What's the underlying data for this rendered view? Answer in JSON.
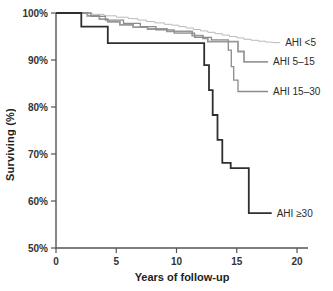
{
  "figure": {
    "background": "#ffffff",
    "axis_color": "#555555",
    "tick_label_color": "#333333"
  },
  "chart_data": {
    "type": "line",
    "subtype": "kaplan-meier-step-survival",
    "title": "",
    "xlabel": "Years of follow-up",
    "ylabel": "Surviving (%)",
    "xlim": [
      0,
      20
    ],
    "ylim": [
      50,
      100
    ],
    "grid": false,
    "legend_position": "right-of-curve-ends",
    "xticks": {
      "values": [
        0,
        5,
        10,
        15,
        20
      ],
      "labels": [
        "0",
        "5",
        "10",
        "15",
        "20"
      ]
    },
    "yticks": {
      "values": [
        100,
        90,
        80,
        70,
        60,
        50
      ],
      "labels": [
        "100%",
        "90%",
        "80%",
        "70%",
        "60%",
        "50%"
      ]
    },
    "series": [
      {
        "name": "AHI <5",
        "color": "#b3b3b3",
        "width": 0.9,
        "end_x": 18.6,
        "steps": [
          [
            0,
            100
          ],
          [
            3.0,
            99.7
          ],
          [
            4.0,
            99.4
          ],
          [
            5.0,
            99.1
          ],
          [
            6.0,
            98.8
          ],
          [
            6.8,
            98.5
          ],
          [
            7.5,
            98.2
          ],
          [
            8.2,
            97.9
          ],
          [
            9.0,
            97.6
          ],
          [
            9.6,
            97.4
          ],
          [
            10.2,
            97.1
          ],
          [
            10.8,
            96.8
          ],
          [
            11.4,
            96.5
          ],
          [
            12.0,
            96.2
          ],
          [
            12.6,
            95.9
          ],
          [
            13.2,
            95.6
          ],
          [
            13.8,
            95.3
          ],
          [
            14.4,
            95.0
          ],
          [
            15.0,
            94.7
          ],
          [
            15.6,
            94.4
          ],
          [
            16.2,
            94.2
          ],
          [
            16.8,
            94.0
          ],
          [
            17.4,
            93.8
          ],
          [
            18.0,
            93.7
          ]
        ]
      },
      {
        "name": "AHI 5–15",
        "color": "#999999",
        "width": 1.8,
        "end_x": 17.6,
        "steps": [
          [
            0,
            100
          ],
          [
            2.6,
            99.4
          ],
          [
            3.6,
            98.7
          ],
          [
            4.3,
            98.1
          ],
          [
            5.3,
            97.5
          ],
          [
            6.4,
            97.0
          ],
          [
            7.6,
            96.6
          ],
          [
            9.2,
            96.1
          ],
          [
            11.3,
            95.2
          ],
          [
            12.2,
            94.6
          ],
          [
            12.6,
            93.9
          ],
          [
            15.1,
            91.8
          ],
          [
            15.6,
            89.6
          ]
        ]
      },
      {
        "name": "AHI 15–30",
        "color": "#8c8c8c",
        "width": 1.3,
        "end_x": 17.6,
        "steps": [
          [
            0,
            100
          ],
          [
            2.9,
            99.3
          ],
          [
            4.1,
            98.5
          ],
          [
            5.6,
            97.8
          ],
          [
            7.0,
            97.1
          ],
          [
            8.3,
            96.4
          ],
          [
            9.8,
            95.7
          ],
          [
            11.5,
            94.8
          ],
          [
            12.9,
            94.3
          ],
          [
            14.3,
            92.1
          ],
          [
            14.55,
            88.6
          ],
          [
            14.75,
            85.7
          ],
          [
            15.1,
            83.3
          ]
        ]
      },
      {
        "name": "AHI ≥30",
        "color": "#2f2f2f",
        "width": 1.8,
        "end_x": 17.9,
        "steps": [
          [
            0,
            100
          ],
          [
            2.1,
            97.1
          ],
          [
            4.3,
            93.6
          ],
          [
            12.3,
            88.9
          ],
          [
            12.7,
            83.6
          ],
          [
            13.0,
            78.3
          ],
          [
            13.4,
            73.0
          ],
          [
            13.8,
            68.1
          ],
          [
            14.5,
            67.0
          ],
          [
            16.0,
            57.4
          ]
        ]
      }
    ]
  }
}
